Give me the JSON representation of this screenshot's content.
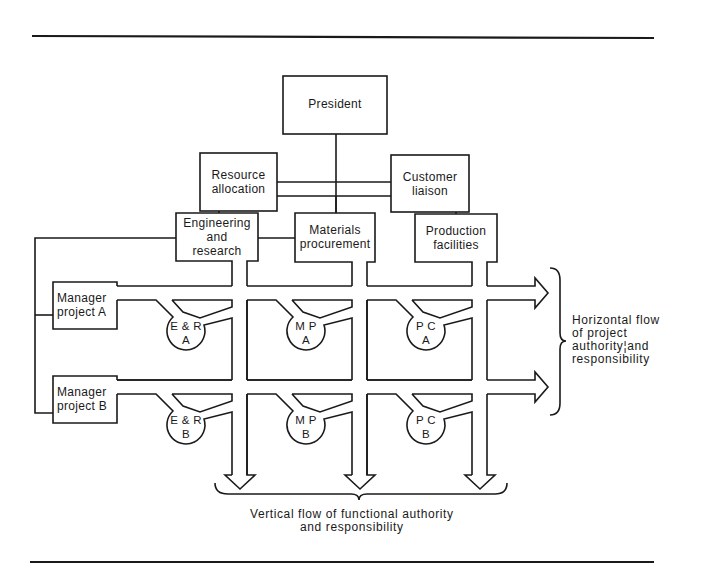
{
  "diagram": {
    "type": "matrix-organization-chart",
    "top": {
      "president": "President",
      "staff": [
        {
          "label": "Resource\nallocation"
        },
        {
          "label": "Customer\nliaison"
        }
      ]
    },
    "functions": [
      {
        "label": "Engineering\nand\nresearch",
        "code": "E & R"
      },
      {
        "label": "Materials\nprocurement",
        "code": "M P"
      },
      {
        "label": "Production\nfacilities",
        "code": "P C"
      }
    ],
    "projects": [
      {
        "label": "Manager\nproject A",
        "suffix": "A"
      },
      {
        "label": "Manager\nproject B",
        "suffix": "B"
      }
    ],
    "cells": [
      [
        "E & R\nA",
        "M P\nA",
        "P C\nA"
      ],
      [
        "E & R\nB",
        "M P\nB",
        "P C\nB"
      ]
    ],
    "annotations": {
      "horizontal": "Horizontal flow\nof project\nauthority¦and\nresponsibility",
      "vertical": "Vertical flow of functional authority\nand responsibility"
    },
    "colors": {
      "ink": "#1a1a1a",
      "background": "#ffffff"
    }
  }
}
